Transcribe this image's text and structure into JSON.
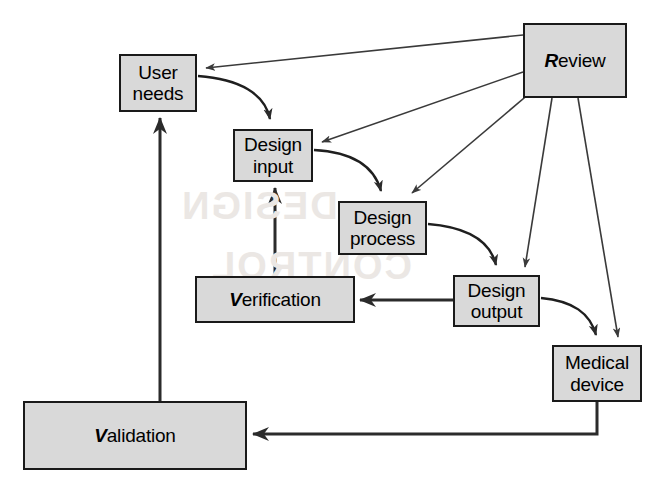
{
  "diagram": {
    "background_color": "#ffffff",
    "box_fill_color": "#d9d9d9",
    "box_border_color": "#1a1a1a",
    "arrow_color": "#333333",
    "nodes": [
      {
        "id": "user-needs",
        "label": "User\nneeds",
        "accent_initial": "",
        "x": 119,
        "y": 54,
        "w": 78,
        "h": 58
      },
      {
        "id": "review",
        "label": "eview",
        "accent_initial": "R",
        "x": 523,
        "y": 23,
        "w": 104,
        "h": 75
      },
      {
        "id": "design-input",
        "label": "Design\ninput",
        "accent_initial": "",
        "x": 233,
        "y": 129,
        "w": 80,
        "h": 53
      },
      {
        "id": "design-process",
        "label": "Design\nprocess",
        "accent_initial": "",
        "x": 338,
        "y": 201,
        "w": 89,
        "h": 54
      },
      {
        "id": "design-output",
        "label": "Design\noutput",
        "accent_initial": "",
        "x": 453,
        "y": 275,
        "w": 87,
        "h": 52
      },
      {
        "id": "verification",
        "label": "erification",
        "accent_initial": "V",
        "x": 195,
        "y": 276,
        "w": 160,
        "h": 47
      },
      {
        "id": "medical-device",
        "label": "Medical\ndevice",
        "accent_initial": "",
        "x": 552,
        "y": 345,
        "w": 90,
        "h": 57
      },
      {
        "id": "validation",
        "label": "alidation",
        "accent_initial": "V",
        "x": 23,
        "y": 401,
        "w": 224,
        "h": 69
      }
    ],
    "edges": [
      {
        "id": "review-to-user-needs",
        "from": "review",
        "to": "user-needs",
        "style": "thin-straight"
      },
      {
        "id": "review-to-design-input",
        "from": "review",
        "to": "design-input",
        "style": "thin-straight"
      },
      {
        "id": "review-to-design-process",
        "from": "review",
        "to": "design-process",
        "style": "thin-straight"
      },
      {
        "id": "review-to-design-output",
        "from": "review",
        "to": "design-output",
        "style": "thin-straight"
      },
      {
        "id": "review-to-medical-device",
        "from": "review",
        "to": "medical-device",
        "style": "thin-straight"
      },
      {
        "id": "user-needs-to-design-input",
        "from": "user-needs",
        "to": "design-input",
        "style": "curve"
      },
      {
        "id": "design-input-to-design-process",
        "from": "design-input",
        "to": "design-process",
        "style": "curve"
      },
      {
        "id": "design-process-to-design-output",
        "from": "design-process",
        "to": "design-output",
        "style": "curve"
      },
      {
        "id": "design-output-to-medical-device",
        "from": "design-output",
        "to": "medical-device",
        "style": "curve"
      },
      {
        "id": "design-output-to-verification",
        "from": "design-output",
        "to": "verification",
        "style": "thick-straight"
      },
      {
        "id": "verification-to-design-input",
        "from": "verification",
        "to": "design-input",
        "style": "thick-straight"
      },
      {
        "id": "medical-device-to-validation",
        "from": "medical-device",
        "to": "validation",
        "style": "thick-elbow"
      },
      {
        "id": "validation-to-user-needs",
        "from": "validation",
        "to": "user-needs",
        "style": "thick-straight"
      }
    ]
  }
}
